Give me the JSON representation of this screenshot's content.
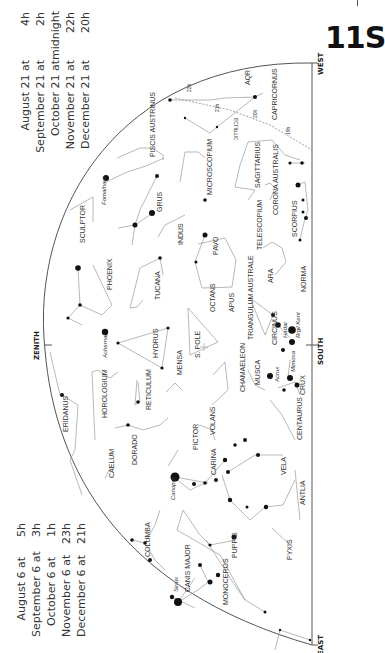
{
  "page": {
    "number": "11S",
    "chart_title": "Southern sky chart 11S"
  },
  "times_top": [
    {
      "date": "August 21 at",
      "time": "4h"
    },
    {
      "date": "September 21 at",
      "time": "2h"
    },
    {
      "date": "October 21 at",
      "time": "midnight"
    },
    {
      "date": "November 21 at",
      "time": "22h"
    },
    {
      "date": "December 21 at",
      "time": "20h"
    }
  ],
  "times_bottom": [
    {
      "date": "August 6 at",
      "time": "5h"
    },
    {
      "date": "September 6 at",
      "time": "3h"
    },
    {
      "date": "October 6 at",
      "time": "1h"
    },
    {
      "date": "November 6 at",
      "time": "23h"
    },
    {
      "date": "December 6 at",
      "time": "21h"
    }
  ],
  "directions": {
    "west": "WEST",
    "south": "SOUTH",
    "east": "EAST",
    "zenith": "ZENITH"
  },
  "ecliptic": {
    "label": "ECLIPTIC",
    "marks": [
      "22h",
      "21h",
      "20h",
      "19h"
    ]
  },
  "pole": "S. POLE",
  "constellations": [
    "AQR",
    "CAPRICORNUS",
    "PISCIS AUSTRINUS",
    "MICROSCOPIUM",
    "SAGITTARIUS",
    "CORONA AUSTRALIS",
    "SCULPTOR",
    "GRUS",
    "INDUS",
    "TELESCOPIUM",
    "SCORPIUS",
    "PAVO",
    "PHOENIX",
    "TUCANA",
    "ARA",
    "NORMA",
    "OCTANS",
    "APUS",
    "TRIANGULUM AUSTRALE",
    "CIRCINUS",
    "HYDRUS",
    "MENSA",
    "CHAMAELEON",
    "MUSCA",
    "CRUX",
    "ERIDANUS",
    "HOROLOGIUM",
    "RETICULUM",
    "VOLANS",
    "CENTAURUS",
    "DORADO",
    "PICTOR",
    "CARINA",
    "VELA",
    "CAELUM",
    "ANTLIA",
    "COLUMBA",
    "PUPPIS",
    "PYXIS",
    "CANIS MAJOR",
    "MONOCEROS"
  ],
  "named_stars": [
    "Fomalhaut",
    "Achernar",
    "Hadar",
    "Rigil Kent",
    "Acrux",
    "Mimosa",
    "Canopus",
    "Sirius"
  ],
  "colors": {
    "ink": "#222222",
    "line": "#999999",
    "background": "#ffffff"
  }
}
